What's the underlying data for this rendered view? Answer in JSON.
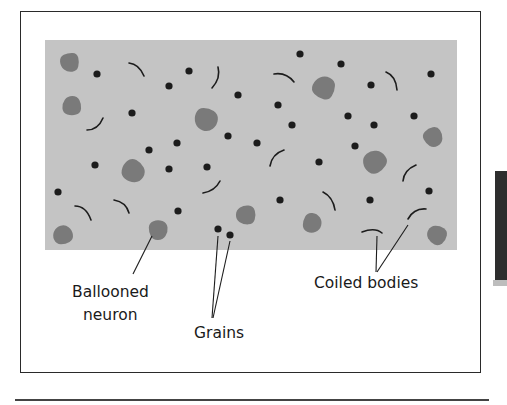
{
  "figure": {
    "colors": {
      "tissue_background": "#c4c4c4",
      "ballooned_neuron": "#7a7a7a",
      "grain": "#1c1c1c",
      "coiled_body": "#1c1c1c",
      "frame": "#2a2a2a"
    },
    "labels": {
      "ballooned_neuron_line1": "Ballooned",
      "ballooned_neuron_line2": "neuron",
      "grains": "Grains",
      "coiled_bodies": "Coiled bodies"
    },
    "ballooned_neurons": [
      {
        "cx": 70,
        "cy": 62,
        "r": 11
      },
      {
        "cx": 72,
        "cy": 106,
        "r": 11
      },
      {
        "cx": 206,
        "cy": 119,
        "r": 13
      },
      {
        "cx": 324,
        "cy": 88,
        "r": 13
      },
      {
        "cx": 133,
        "cy": 171,
        "r": 13
      },
      {
        "cx": 375,
        "cy": 162,
        "r": 13
      },
      {
        "cx": 433,
        "cy": 137,
        "r": 11
      },
      {
        "cx": 63,
        "cy": 235,
        "r": 11
      },
      {
        "cx": 158,
        "cy": 230,
        "r": 11
      },
      {
        "cx": 246,
        "cy": 215,
        "r": 11
      },
      {
        "cx": 312,
        "cy": 223,
        "r": 11
      },
      {
        "cx": 437,
        "cy": 235,
        "r": 11
      }
    ],
    "grains": [
      [
        97,
        74
      ],
      [
        169,
        86
      ],
      [
        189,
        71
      ],
      [
        300,
        54
      ],
      [
        341,
        64
      ],
      [
        132,
        113
      ],
      [
        238,
        95
      ],
      [
        278,
        105
      ],
      [
        292,
        125
      ],
      [
        371,
        85
      ],
      [
        348,
        116
      ],
      [
        374,
        125
      ],
      [
        414,
        116
      ],
      [
        431,
        74
      ],
      [
        149,
        150
      ],
      [
        177,
        143
      ],
      [
        228,
        136
      ],
      [
        257,
        143
      ],
      [
        355,
        146
      ],
      [
        95,
        165
      ],
      [
        169,
        169
      ],
      [
        207,
        167
      ],
      [
        319,
        162
      ],
      [
        58,
        192
      ],
      [
        178,
        211
      ],
      [
        280,
        200
      ],
      [
        370,
        200
      ],
      [
        429,
        191
      ],
      [
        218,
        229
      ],
      [
        230,
        235
      ]
    ],
    "coiled_bodies": [
      "M129,63 Q139,64 144,76",
      "M218,67 Q221,78 212,88",
      "M274,74 Q286,72 294,82",
      "M386,72 Q396,76 397,90",
      "M87,130 Q98,130 103,118",
      "M270,166 Q272,154 284,150",
      "M403,181 Q404,170 416,165",
      "M203,193 Q215,191 220,181",
      "M75,206 Q86,206 91,220",
      "M114,200 Q126,202 129,213",
      "M323,192 Q333,197 335,210",
      "M408,219 Q414,208 426,209",
      "M362,232 Q375,227 382,233"
    ],
    "leader_lines": {
      "ballooned_neuron": {
        "x1": 152,
        "y1": 236,
        "x2": 133,
        "y2": 274
      },
      "grains_a": {
        "x1": 218,
        "y1": 236,
        "x2": 212,
        "y2": 318
      },
      "grains_b": {
        "x1": 230,
        "y1": 241,
        "x2": 213,
        "y2": 318
      },
      "coiled_a": {
        "x1": 377,
        "y1": 236,
        "x2": 376,
        "y2": 272
      },
      "coiled_b": {
        "x1": 408,
        "y1": 225,
        "x2": 377,
        "y2": 272
      }
    }
  }
}
